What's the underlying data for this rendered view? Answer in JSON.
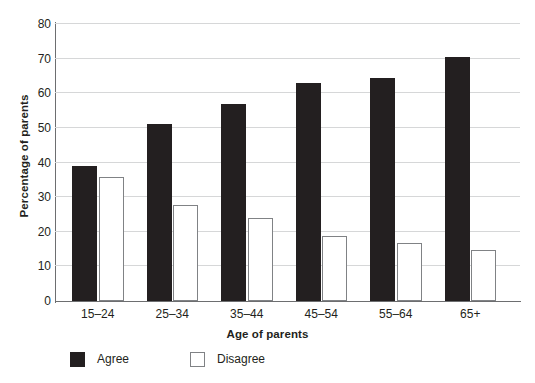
{
  "chart_data": {
    "type": "bar",
    "title": "",
    "xlabel": "Age of parents",
    "ylabel": "Percentage of parents",
    "categories": [
      "15–24",
      "25–34",
      "35–44",
      "45–54",
      "55–64",
      "65+"
    ],
    "series": [
      {
        "name": "Agree",
        "color": "#231f20",
        "values": [
          39.0,
          51.0,
          57.0,
          63.0,
          64.5,
          70.5
        ]
      },
      {
        "name": "Disagree",
        "color": "#ffffff",
        "values": [
          35.7,
          27.7,
          24.0,
          18.7,
          16.8,
          14.8
        ]
      }
    ],
    "ylim": [
      0,
      80
    ],
    "yticks": [
      0,
      10,
      20,
      30,
      40,
      50,
      60,
      70,
      80
    ],
    "ytick_labels": [
      "0",
      "10",
      "20",
      "30",
      "40",
      "50",
      "60",
      "70",
      "80"
    ],
    "grid": "horizontal",
    "legend_position": "bottom-left",
    "legend": [
      {
        "label": "Agree",
        "swatch": "filled-black-square"
      },
      {
        "label": "Disagree",
        "swatch": "outlined-white-square"
      }
    ],
    "colors": {
      "agree": "#231f20",
      "disagree_fill": "#ffffff",
      "disagree_border": "#808285",
      "gridline": "#d6d7d8",
      "axis": "#6d6e70",
      "text": "#231f20",
      "background": "#ffffff"
    }
  }
}
